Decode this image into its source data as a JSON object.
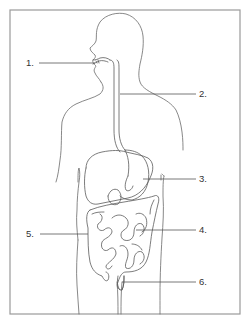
{
  "diagram": {
    "labels": [
      {
        "id": "1",
        "text": "1.",
        "side": "left",
        "points_to": "mouth"
      },
      {
        "id": "2",
        "text": "2.",
        "side": "right",
        "points_to": "esophagus"
      },
      {
        "id": "3",
        "text": "3.",
        "side": "right",
        "points_to": "stomach"
      },
      {
        "id": "4",
        "text": "4.",
        "side": "right",
        "points_to": "small intestine"
      },
      {
        "id": "5",
        "text": "5.",
        "side": "left",
        "points_to": "large intestine"
      },
      {
        "id": "6",
        "text": "6.",
        "side": "right",
        "points_to": "rectum"
      }
    ],
    "colors": {
      "background": "#ffffff",
      "line": "#5a5a5a",
      "frame": "#9a9a9a",
      "text": "#333333"
    }
  }
}
